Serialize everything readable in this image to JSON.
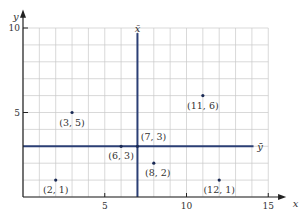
{
  "chart_data": {
    "type": "scatter",
    "title": "",
    "xlabel": "x",
    "ylabel": "y",
    "xlim": [
      0,
      15
    ],
    "ylim": [
      0,
      10
    ],
    "grid": true,
    "x_ticks": [
      5,
      10,
      15
    ],
    "y_ticks": [
      5,
      10
    ],
    "points": [
      {
        "x": 2,
        "y": 1,
        "label": "(2, 1)"
      },
      {
        "x": 3,
        "y": 5,
        "label": "(3, 5)"
      },
      {
        "x": 6,
        "y": 3,
        "label": "(6, 3)"
      },
      {
        "x": 7,
        "y": 3,
        "label": "(7, 3)"
      },
      {
        "x": 8,
        "y": 2,
        "label": "(8, 2)"
      },
      {
        "x": 11,
        "y": 6,
        "label": "(11, 6)"
      },
      {
        "x": 12,
        "y": 1,
        "label": "(12, 1)"
      }
    ],
    "reference_lines": [
      {
        "orientation": "vertical",
        "value": 7,
        "label": "x̄"
      },
      {
        "orientation": "horizontal",
        "value": 3,
        "label": "ȳ"
      }
    ],
    "colors": {
      "mean_lines": "#2b3f75",
      "grid": "#c8c8c8",
      "axes": "#222222",
      "points": "#1a2a55"
    }
  }
}
